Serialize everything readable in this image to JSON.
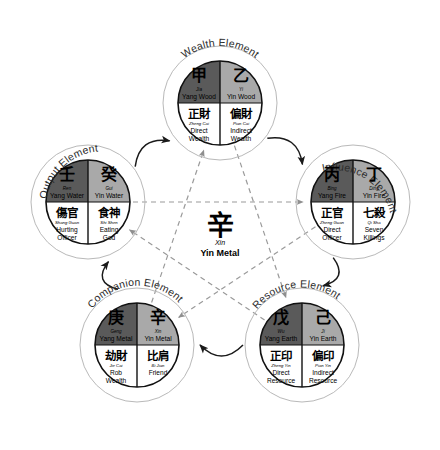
{
  "diagram": {
    "center": {
      "char": "辛",
      "pinyin": "Xin",
      "english": "Yin Metal"
    },
    "colors": {
      "yang_fill": "#5a5a5a",
      "yin_fill": "#a9a9a9",
      "bottom_fill": "#ffffff",
      "outline": "#111111",
      "ring": "#b9b9b9",
      "solid_arrow": "#1a1a1a",
      "dashed_arrow": "#9a9a9a",
      "text": "#000000"
    },
    "cycles": {
      "producing": "solid curved arrows around outer pentagon",
      "controlling": "dashed pentagram arrows through center"
    },
    "nodes": [
      {
        "id": "wealth",
        "ring_label": "Wealth Element",
        "cx": 220,
        "cy": 103,
        "yang_stem": {
          "char": "甲",
          "pinyin": "Jia",
          "english": "Yang Wood"
        },
        "yin_stem": {
          "char": "乙",
          "pinyin": "Yi",
          "english": "Yin Wood"
        },
        "left_relation": {
          "char": "正財",
          "pinyin": "Zheng Cai",
          "english_line1": "Direct",
          "english_line2": "Wealth"
        },
        "right_relation": {
          "char": "偏財",
          "pinyin": "Pian Cai",
          "english_line1": "Indirect",
          "english_line2": "Wealth"
        }
      },
      {
        "id": "influence",
        "ring_label": "Influence Element",
        "cx": 353,
        "cy": 202,
        "yang_stem": {
          "char": "丙",
          "pinyin": "Bing",
          "english": "Yang Fire"
        },
        "yin_stem": {
          "char": "丁",
          "pinyin": "Ding",
          "english": "Yin Fire"
        },
        "left_relation": {
          "char": "正官",
          "pinyin": "Zheng Guan",
          "english_line1": "Direct",
          "english_line2": "Officer"
        },
        "right_relation": {
          "char": "七殺",
          "pinyin": "Qi Sha",
          "english_line1": "Seven",
          "english_line2": "Killings"
        }
      },
      {
        "id": "resource",
        "ring_label": "Resource Element",
        "cx": 302,
        "cy": 345,
        "yang_stem": {
          "char": "戊",
          "pinyin": "Wu",
          "english": "Yang Earth"
        },
        "yin_stem": {
          "char": "己",
          "pinyin": "Ji",
          "english": "Yin Earth"
        },
        "left_relation": {
          "char": "正印",
          "pinyin": "Zheng Yin",
          "english_line1": "Direct",
          "english_line2": "Resource"
        },
        "right_relation": {
          "char": "偏印",
          "pinyin": "Pian Yin",
          "english_line1": "Indirect",
          "english_line2": "Resource"
        }
      },
      {
        "id": "companion",
        "ring_label": "Companion Element",
        "cx": 137,
        "cy": 345,
        "yang_stem": {
          "char": "庚",
          "pinyin": "Geng",
          "english": "Yang Metal"
        },
        "yin_stem": {
          "char": "辛",
          "pinyin": "Xin",
          "english": "Yin Metal"
        },
        "left_relation": {
          "char": "劫財",
          "pinyin": "Jie Cai",
          "english_line1": "Rob",
          "english_line2": "Wealth"
        },
        "right_relation": {
          "char": "比肩",
          "pinyin": "Bi Jian",
          "english_line1": "Friend",
          "english_line2": ""
        }
      },
      {
        "id": "output",
        "ring_label": "Output Element",
        "cx": 88,
        "cy": 202,
        "yang_stem": {
          "char": "壬",
          "pinyin": "Ren",
          "english": "Yang Water"
        },
        "yin_stem": {
          "char": "癸",
          "pinyin": "Gui",
          "english": "Yin Water"
        },
        "left_relation": {
          "char": "傷官",
          "pinyin": "Shang Guan",
          "english_line1": "Hurting",
          "english_line2": "Officer"
        },
        "right_relation": {
          "char": "食神",
          "pinyin": "Shi Shen",
          "english_line1": "Eating",
          "english_line2": "God"
        }
      }
    ]
  }
}
